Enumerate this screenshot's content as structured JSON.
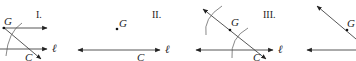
{
  "panels": [
    {
      "id": "I",
      "label": "I.",
      "point_G": "G",
      "point_C": "C",
      "line": "ℓ"
    },
    {
      "id": "II",
      "label": "II.",
      "point_G": "G",
      "point_C": "C",
      "line": "ℓ"
    },
    {
      "id": "III",
      "label": "III.",
      "point_G": "G",
      "point_C": "C",
      "line": "ℓ"
    },
    {
      "id": "IV",
      "label": "",
      "point_G": "G"
    }
  ],
  "colors": {
    "stroke": "#333333",
    "text": "#222222",
    "background": "#ffffff"
  }
}
